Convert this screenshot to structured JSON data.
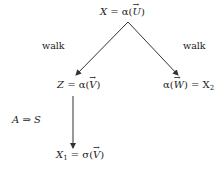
{
  "diagram": {
    "nodes": {
      "top": {
        "lhs": "X",
        "eq": " = α(",
        "vec": "U",
        "close": ")"
      },
      "left": {
        "lhs": "Z",
        "eq": " = α(",
        "vec": "V",
        "close": ")"
      },
      "right": {
        "pre": "α(",
        "vec": "W",
        "post": ") = X",
        "sub": "2"
      },
      "bottom": {
        "lhs": "X",
        "sub": "1",
        "eq": " = σ(",
        "vec": "V",
        "close": ")"
      }
    },
    "edges": [
      {
        "from": "top",
        "to": "left",
        "label": "walk"
      },
      {
        "from": "top",
        "to": "right",
        "label": "walk"
      },
      {
        "from": "left",
        "to": "bottom",
        "label": ""
      }
    ],
    "side_annotation": "A ⇒ S",
    "colors": {
      "line": "#333333",
      "text": "#222222",
      "background": "#ffffff"
    }
  }
}
